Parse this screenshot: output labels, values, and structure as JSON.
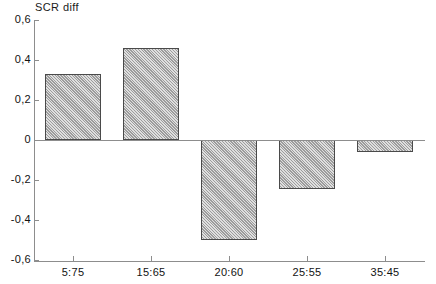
{
  "chart_data": {
    "type": "bar",
    "title": "SCR diff",
    "xlabel": "",
    "ylabel": "",
    "categories": [
      "5:75",
      "15:65",
      "20:60",
      "25:55",
      "35:45"
    ],
    "values": [
      0.33,
      0.46,
      -0.5,
      -0.245,
      -0.06
    ],
    "ylim": [
      -0.6,
      0.6
    ],
    "ytick_labels": [
      "0,6",
      "0,4",
      "0,2",
      "0",
      "-0,2",
      "-0,4",
      "-0,6"
    ],
    "ytick_values": [
      0.6,
      0.4,
      0.2,
      0,
      -0.2,
      -0.4,
      -0.6
    ],
    "grid": false,
    "legend": null,
    "decimal_separator": ",",
    "bar_fill": "#b9b9b9",
    "bar_edge": "#4a4a4a",
    "axis_color": "#8d8d8d",
    "zero_line": true,
    "annotations": []
  }
}
